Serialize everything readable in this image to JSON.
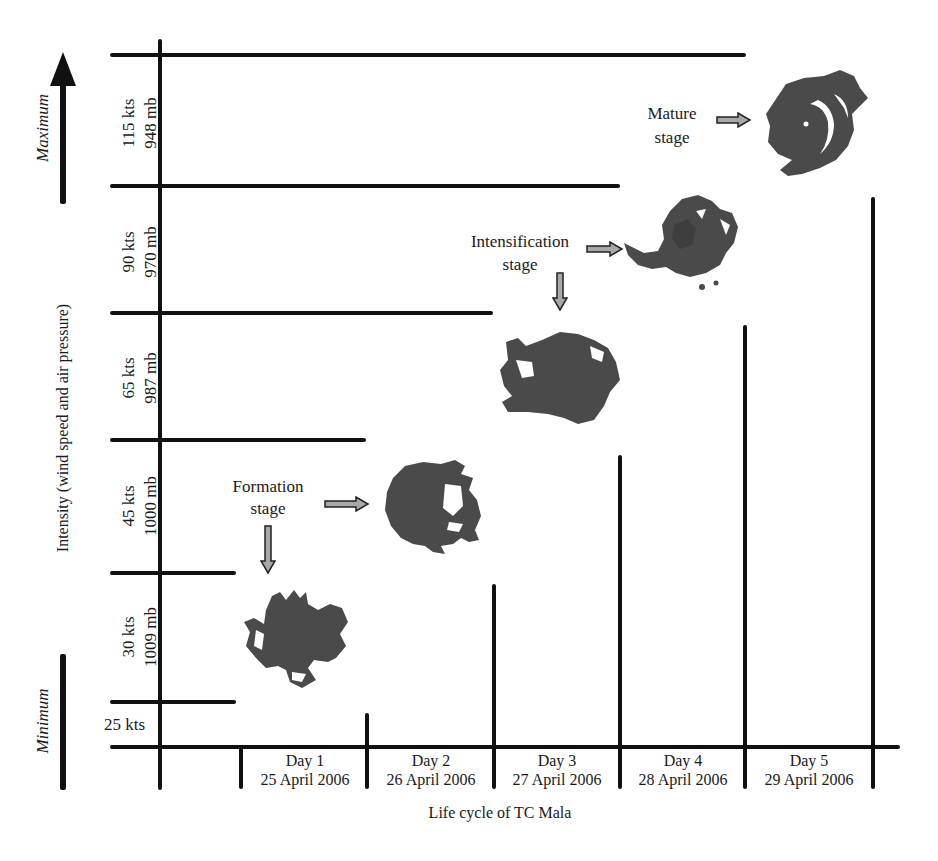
{
  "diagram": {
    "title": "Life cycle of TC Mala",
    "x_axis_label": "Life cycle of TC Mala",
    "y_axis_label": "Intensity (wind speed and air pressure)",
    "y_direction": {
      "maximum_label": "Maximum",
      "minimum_label": "Minimum"
    },
    "intensity_levels": [
      {
        "wind": "115 kts",
        "pressure": "948 mb"
      },
      {
        "wind": "90 kts",
        "pressure": "970 mb"
      },
      {
        "wind": "65 kts",
        "pressure": "987 mb"
      },
      {
        "wind": "45 kts",
        "pressure": "1000 mb"
      },
      {
        "wind": "30 kts",
        "pressure": "1009 mb"
      },
      {
        "wind": "25 kts",
        "pressure": ""
      }
    ],
    "days": [
      {
        "day": "Day 1",
        "date": "25 April 2006"
      },
      {
        "day": "Day 2",
        "date": "26 April 2006"
      },
      {
        "day": "Day 3",
        "date": "27 April 2006"
      },
      {
        "day": "Day 4",
        "date": "28 April 2006"
      },
      {
        "day": "Day 5",
        "date": "29 April 2006"
      }
    ],
    "stages": [
      {
        "line1": "Formation",
        "line2": "stage"
      },
      {
        "line1": "Intensification",
        "line2": "stage"
      },
      {
        "line1": "Mature",
        "line2": "stage"
      }
    ],
    "storm_images": [
      {
        "name": "storm-day1",
        "day": "Day 1",
        "intensity": "30 kts"
      },
      {
        "name": "storm-day2",
        "day": "Day 2",
        "intensity": "45 kts"
      },
      {
        "name": "storm-day3",
        "day": "Day 3",
        "intensity": "65 kts"
      },
      {
        "name": "storm-day4",
        "day": "Day 4",
        "intensity": "90 kts"
      },
      {
        "name": "storm-day5",
        "day": "Day 5",
        "intensity": "115 kts"
      }
    ],
    "colors": {
      "line": "#111111",
      "storm_fill": "#4a4a4a",
      "arrow_fill": "#9a9a9a"
    }
  }
}
